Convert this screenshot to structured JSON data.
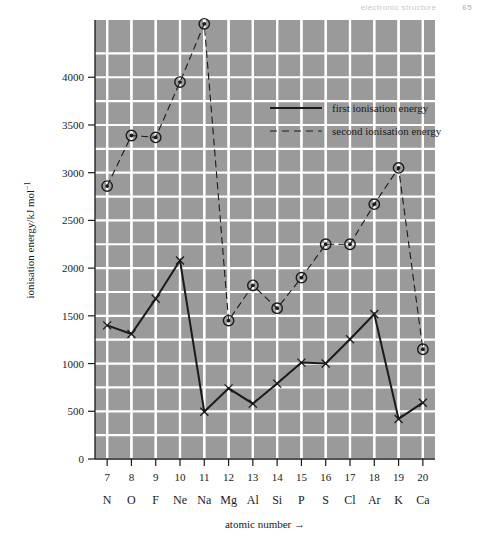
{
  "running_head": {
    "title": "electronic structure",
    "page": "65"
  },
  "chart_data": {
    "type": "line",
    "title": "",
    "xlabel": "atomic number →",
    "ylabel": "ionisation energy/kJ mol",
    "ylabel_exponent": "−1",
    "xlim": [
      6.5,
      20.5
    ],
    "ylim": [
      0,
      4600
    ],
    "ytick_values": [
      0,
      500,
      1000,
      1500,
      2000,
      2500,
      3000,
      3500,
      4000
    ],
    "ytick_labels": [
      "0",
      "500",
      "1000",
      "1500",
      "2000",
      "2500",
      "3000",
      "3500",
      "4000"
    ],
    "gridlines": true,
    "grid_color": "#ffffff",
    "plot_background": "#9a9a9a",
    "line_color": "#1a1a1a",
    "legend_position": "upper-center-right",
    "x": [
      7,
      8,
      9,
      10,
      11,
      12,
      13,
      14,
      15,
      16,
      17,
      18,
      19,
      20
    ],
    "xtick_labels": [
      "7",
      "8",
      "9",
      "10",
      "11",
      "12",
      "13",
      "14",
      "15",
      "16",
      "17",
      "18",
      "19",
      "20"
    ],
    "element_labels": [
      "N",
      "O",
      "F",
      "Ne",
      "Na",
      "Mg",
      "Al",
      "Si",
      "P",
      "S",
      "Cl",
      "Ar",
      "K",
      "Ca"
    ],
    "series": [
      {
        "name": "first ionisation energy",
        "style": "solid",
        "marker": "cross",
        "values": [
          1400,
          1310,
          1680,
          2080,
          495,
          740,
          580,
          790,
          1010,
          1000,
          1255,
          1520,
          420,
          590
        ]
      },
      {
        "name": "second ionisation energy",
        "style": "dashed",
        "marker": "circle-dot",
        "values": [
          2860,
          3390,
          3370,
          3950,
          4560,
          1450,
          1820,
          1580,
          1900,
          2250,
          2250,
          2670,
          3050,
          1150
        ]
      }
    ]
  }
}
